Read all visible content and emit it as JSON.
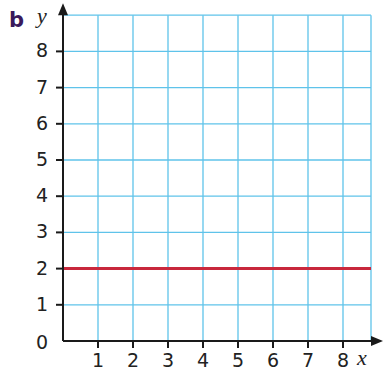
{
  "part_label": "b",
  "colors": {
    "grid": "#5fc3ea",
    "axis": "#1a1a1a",
    "line": "#c8283c",
    "part_label": "#3a1a5c"
  },
  "chart_data": {
    "type": "line",
    "title": "",
    "xlabel": "x",
    "ylabel": "y",
    "x_ticks": [
      1,
      2,
      3,
      4,
      5,
      6,
      7,
      8
    ],
    "y_ticks": [
      1,
      2,
      3,
      4,
      5,
      6,
      7,
      8
    ],
    "origin_label": "0",
    "xlim": [
      0,
      8.8
    ],
    "ylim": [
      0,
      9
    ],
    "grid": true,
    "series": [
      {
        "name": "y = 2",
        "x": [
          0,
          8.8
        ],
        "y": [
          2,
          2
        ],
        "color": "#c8283c"
      }
    ]
  }
}
